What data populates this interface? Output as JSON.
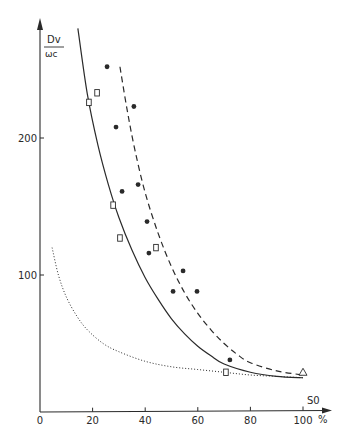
{
  "chart_data": {
    "type": "scatter",
    "title": "",
    "xlabel": "S0",
    "xunit": "%",
    "ylabel": "Dv / ωc",
    "ylabel_numerator": "Dv",
    "ylabel_denominator": "ωc",
    "xlim": [
      0,
      100
    ],
    "ylim": [
      0,
      290
    ],
    "grid": false,
    "legend": null,
    "x_ticks": [
      0,
      20,
      40,
      60,
      80,
      100
    ],
    "x_tick_labels": [
      "0",
      "20",
      "40",
      "60",
      "80",
      "100"
    ],
    "y_ticks": [
      100,
      200
    ],
    "y_tick_labels": [
      "100",
      "200"
    ],
    "series": [
      {
        "name": "filled circles",
        "marker": "circle-filled",
        "points": [
          [
            25.5,
            252
          ],
          [
            28.9,
            208
          ],
          [
            35.7,
            223
          ],
          [
            31.2,
            161
          ],
          [
            37.3,
            166
          ],
          [
            40.7,
            139
          ],
          [
            41.4,
            116
          ],
          [
            54.4,
            103
          ],
          [
            50.6,
            88
          ],
          [
            59.7,
            88
          ],
          [
            72.2,
            38
          ]
        ]
      },
      {
        "name": "open squares",
        "marker": "square-open",
        "points": [
          [
            18.6,
            226
          ],
          [
            21.7,
            233
          ],
          [
            27.8,
            151
          ],
          [
            30.4,
            127
          ],
          [
            44.1,
            120
          ],
          [
            70.7,
            29
          ]
        ]
      },
      {
        "name": "open triangle",
        "marker": "triangle-open",
        "points": [
          [
            100,
            29
          ]
        ]
      },
      {
        "name": "solid curve",
        "style": "solid",
        "points": [
          [
            14.4,
            280
          ],
          [
            18,
            232
          ],
          [
            22,
            195
          ],
          [
            26,
            166
          ],
          [
            30,
            142
          ],
          [
            35,
            118
          ],
          [
            40,
            98
          ],
          [
            45,
            82
          ],
          [
            50,
            68
          ],
          [
            55,
            57
          ],
          [
            60,
            48
          ],
          [
            65,
            41
          ],
          [
            70,
            35
          ],
          [
            80,
            29
          ],
          [
            90,
            26
          ],
          [
            100,
            25
          ]
        ]
      },
      {
        "name": "dashed curve",
        "style": "dashed",
        "points": [
          [
            30.4,
            252
          ],
          [
            33,
            222
          ],
          [
            36,
            192
          ],
          [
            40,
            160
          ],
          [
            45,
            130
          ],
          [
            50,
            106
          ],
          [
            55,
            87
          ],
          [
            60,
            72
          ],
          [
            65,
            60
          ],
          [
            70,
            50
          ],
          [
            75,
            42
          ],
          [
            80,
            36
          ],
          [
            90,
            30
          ],
          [
            100,
            27
          ]
        ]
      },
      {
        "name": "dotted curve",
        "style": "dotted",
        "points": [
          [
            4.6,
            120
          ],
          [
            7,
            100
          ],
          [
            10,
            84
          ],
          [
            14,
            70
          ],
          [
            18,
            60
          ],
          [
            24,
            50
          ],
          [
            30,
            44
          ],
          [
            40,
            37
          ],
          [
            50,
            33
          ],
          [
            60,
            31
          ],
          [
            70,
            29
          ],
          [
            80,
            27
          ],
          [
            90,
            26
          ],
          [
            100,
            25
          ]
        ]
      }
    ]
  },
  "colors": {
    "ink": "#2a2a2a",
    "background": "#ffffff"
  }
}
